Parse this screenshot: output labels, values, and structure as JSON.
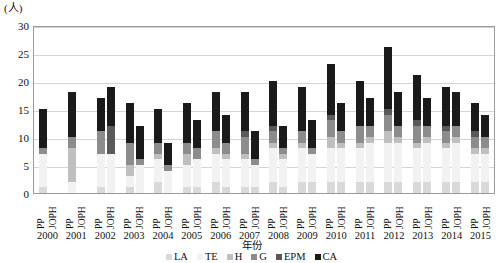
{
  "chart_data": {
    "type": "bar",
    "stacked": true,
    "title": "",
    "xlabel": "年份",
    "ylabel": "(人)",
    "unit_label": "(人)",
    "ylim": [
      0,
      30
    ],
    "yticks": [
      0,
      5,
      10,
      15,
      20,
      25,
      30
    ],
    "grid": true,
    "legend_position": "bottom",
    "categories": [
      "2000",
      "2001",
      "2002",
      "2003",
      "2004",
      "2005",
      "2006",
      "2007",
      "2008",
      "2009",
      "2010",
      "2011",
      "2012",
      "2013",
      "2014",
      "2015"
    ],
    "subcategories": [
      "PP",
      "JOPH"
    ],
    "series": [
      {
        "name": "LA",
        "color": "#d9d9d9"
      },
      {
        "name": "TE",
        "color": "#f2f2f2"
      },
      {
        "name": "H",
        "color": "#bfbfbf"
      },
      {
        "name": "G",
        "color": "#8c8c8c"
      },
      {
        "name": "EPM",
        "color": "#595959"
      },
      {
        "name": "CA",
        "color": "#1a1a1a"
      }
    ],
    "groups": [
      {
        "year": "2000",
        "bars": [
          {
            "label": "PP",
            "total": 15,
            "values": {
              "LA": 1,
              "TE": 6,
              "H": 0,
              "G": 1,
              "EPM": 0,
              "CA": 7
            }
          },
          {
            "label": "JOPH",
            "total": 0,
            "values": {
              "LA": 0,
              "TE": 0,
              "H": 0,
              "G": 0,
              "EPM": 0,
              "CA": 0
            }
          }
        ]
      },
      {
        "year": "2001",
        "bars": [
          {
            "label": "PP",
            "total": 18,
            "values": {
              "LA": 0,
              "TE": 2,
              "H": 6,
              "G": 2,
              "EPM": 0,
              "CA": 8
            }
          },
          {
            "label": "JOPH",
            "total": 0,
            "values": {
              "LA": 0,
              "TE": 0,
              "H": 0,
              "G": 0,
              "EPM": 0,
              "CA": 0
            }
          }
        ]
      },
      {
        "year": "2002",
        "bars": [
          {
            "label": "PP",
            "total": 17,
            "values": {
              "LA": 1,
              "TE": 6,
              "H": 0,
              "G": 4,
              "EPM": 0,
              "CA": 6
            }
          },
          {
            "label": "JOPH",
            "total": 19,
            "values": {
              "LA": 0,
              "TE": 7,
              "H": 0,
              "G": 0,
              "EPM": 5,
              "CA": 7
            }
          }
        ]
      },
      {
        "year": "2003",
        "bars": [
          {
            "label": "PP",
            "total": 16,
            "values": {
              "LA": 1,
              "TE": 2,
              "H": 2,
              "G": 4,
              "EPM": 0,
              "CA": 7
            }
          },
          {
            "label": "JOPH",
            "total": 12,
            "values": {
              "LA": 0,
              "TE": 5,
              "H": 0,
              "G": 1,
              "EPM": 0,
              "CA": 6
            }
          }
        ]
      },
      {
        "year": "2004",
        "bars": [
          {
            "label": "PP",
            "total": 15,
            "values": {
              "LA": 2,
              "TE": 4,
              "H": 1,
              "G": 2,
              "EPM": 0,
              "CA": 6
            }
          },
          {
            "label": "JOPH",
            "total": 9,
            "values": {
              "LA": 0,
              "TE": 4,
              "H": 0,
              "G": 1,
              "EPM": 0,
              "CA": 4
            }
          }
        ]
      },
      {
        "year": "2005",
        "bars": [
          {
            "label": "PP",
            "total": 16,
            "values": {
              "LA": 1,
              "TE": 4,
              "H": 2,
              "G": 2,
              "EPM": 0,
              "CA": 7
            }
          },
          {
            "label": "JOPH",
            "total": 13,
            "values": {
              "LA": 1,
              "TE": 5,
              "H": 0,
              "G": 2,
              "EPM": 0,
              "CA": 5
            }
          }
        ]
      },
      {
        "year": "2006",
        "bars": [
          {
            "label": "PP",
            "total": 18,
            "values": {
              "LA": 2,
              "TE": 5,
              "H": 1,
              "G": 3,
              "EPM": 0,
              "CA": 7
            }
          },
          {
            "label": "JOPH",
            "total": 14,
            "values": {
              "LA": 1,
              "TE": 5,
              "H": 1,
              "G": 2,
              "EPM": 0,
              "CA": 5
            }
          }
        ]
      },
      {
        "year": "2007",
        "bars": [
          {
            "label": "PP",
            "total": 18,
            "values": {
              "LA": 1,
              "TE": 5,
              "H": 1,
              "G": 3,
              "EPM": 1,
              "CA": 7
            }
          },
          {
            "label": "JOPH",
            "total": 11,
            "values": {
              "LA": 1,
              "TE": 4,
              "H": 0,
              "G": 1,
              "EPM": 0,
              "CA": 5
            }
          }
        ]
      },
      {
        "year": "2008",
        "bars": [
          {
            "label": "PP",
            "total": 20,
            "values": {
              "LA": 2,
              "TE": 6,
              "H": 1,
              "G": 2,
              "EPM": 1,
              "CA": 8
            }
          },
          {
            "label": "JOPH",
            "total": 12,
            "values": {
              "LA": 1,
              "TE": 5,
              "H": 1,
              "G": 1,
              "EPM": 0,
              "CA": 4
            }
          }
        ]
      },
      {
        "year": "2009",
        "bars": [
          {
            "label": "PP",
            "total": 19,
            "values": {
              "LA": 2,
              "TE": 6,
              "H": 1,
              "G": 2,
              "EPM": 0,
              "CA": 8
            }
          },
          {
            "label": "JOPH",
            "total": 13,
            "values": {
              "LA": 2,
              "TE": 5,
              "H": 0,
              "G": 1,
              "EPM": 0,
              "CA": 5
            }
          }
        ]
      },
      {
        "year": "2010",
        "bars": [
          {
            "label": "PP",
            "total": 23,
            "values": {
              "LA": 2,
              "TE": 6,
              "H": 2,
              "G": 3,
              "EPM": 1,
              "CA": 9
            }
          },
          {
            "label": "JOPH",
            "total": 16,
            "values": {
              "LA": 2,
              "TE": 6,
              "H": 1,
              "G": 2,
              "EPM": 0,
              "CA": 5
            }
          }
        ]
      },
      {
        "year": "2011",
        "bars": [
          {
            "label": "PP",
            "total": 20,
            "values": {
              "LA": 2,
              "TE": 6,
              "H": 1,
              "G": 3,
              "EPM": 0,
              "CA": 8
            }
          },
          {
            "label": "JOPH",
            "total": 17,
            "values": {
              "LA": 2,
              "TE": 7,
              "H": 1,
              "G": 2,
              "EPM": 0,
              "CA": 5
            }
          }
        ]
      },
      {
        "year": "2012",
        "bars": [
          {
            "label": "PP",
            "total": 26,
            "values": {
              "LA": 2,
              "TE": 7,
              "H": 2,
              "G": 3,
              "EPM": 1,
              "CA": 11
            }
          },
          {
            "label": "JOPH",
            "total": 18,
            "values": {
              "LA": 2,
              "TE": 7,
              "H": 1,
              "G": 2,
              "EPM": 0,
              "CA": 6
            }
          }
        ]
      },
      {
        "year": "2013",
        "bars": [
          {
            "label": "PP",
            "total": 21,
            "values": {
              "LA": 2,
              "TE": 6,
              "H": 1,
              "G": 3,
              "EPM": 1,
              "CA": 8
            }
          },
          {
            "label": "JOPH",
            "total": 17,
            "values": {
              "LA": 2,
              "TE": 7,
              "H": 1,
              "G": 2,
              "EPM": 0,
              "CA": 5
            }
          }
        ]
      },
      {
        "year": "2014",
        "bars": [
          {
            "label": "PP",
            "total": 19,
            "values": {
              "LA": 2,
              "TE": 6,
              "H": 1,
              "G": 2,
              "EPM": 1,
              "CA": 7
            }
          },
          {
            "label": "JOPH",
            "total": 18,
            "values": {
              "LA": 2,
              "TE": 7,
              "H": 1,
              "G": 2,
              "EPM": 0,
              "CA": 6
            }
          }
        ]
      },
      {
        "year": "2015",
        "bars": [
          {
            "label": "PP",
            "total": 16,
            "values": {
              "LA": 2,
              "TE": 5,
              "H": 1,
              "G": 2,
              "EPM": 1,
              "CA": 5
            }
          },
          {
            "label": "JOPH",
            "total": 14,
            "values": {
              "LA": 2,
              "TE": 5,
              "H": 1,
              "G": 2,
              "EPM": 0,
              "CA": 4
            }
          }
        ]
      }
    ]
  }
}
